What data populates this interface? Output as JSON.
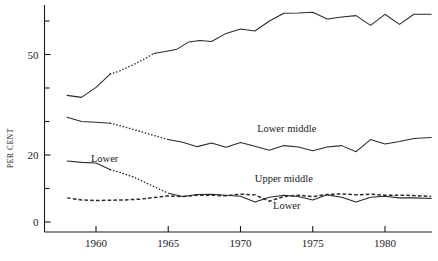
{
  "chart_data": {
    "type": "line",
    "title": "",
    "xlabel": "",
    "ylabel": "PER CENT",
    "xlim": [
      1957.2,
      1983.6
    ],
    "ylim": [
      -2,
      72
    ],
    "grid": false,
    "legend": "inline-annotations",
    "y_ticks_major": [
      0,
      20,
      50
    ],
    "y_ticks_minor": [
      10,
      30,
      40,
      60
    ],
    "x_ticks": [
      1960,
      1965,
      1970,
      1975,
      1980
    ],
    "x_tick_labels": [
      "1960",
      "1965",
      "1970",
      "1975",
      "1980"
    ],
    "y_tick_labels": [
      "0",
      "20",
      "50"
    ],
    "series": [
      {
        "name": "Middle middle",
        "style": "solid-with-dotted-gap",
        "label_x": 1973.0,
        "label_y": 70.0,
        "x": [
          1958.0,
          1959.0,
          1960.0,
          1961.0,
          1961.6,
          1962.4,
          1963.2,
          1964.0,
          1964.8,
          1965.6,
          1966.4,
          1967.2,
          1968.0,
          1969.0,
          1970.0,
          1971.0,
          1972.0,
          1973.0,
          1974.0,
          1975.0,
          1976.0,
          1977.0,
          1978.0,
          1979.0,
          1980.0,
          1981.0,
          1982.0,
          1983.2
        ],
        "y": [
          37.8,
          37.2,
          40.2,
          44.2,
          45.0,
          46.6,
          48.3,
          50.3,
          50.9,
          51.6,
          53.7,
          54.2,
          53.9,
          56.3,
          57.6,
          57.0,
          60.0,
          62.3,
          62.4,
          62.6,
          60.6,
          61.2,
          61.6,
          58.7,
          62.0,
          59.0,
          62.0,
          62.0
        ],
        "dotted_segment_x": [
          1961.0,
          1964.0
        ],
        "notes": "rises from ~38 to ~62 per cent"
      },
      {
        "name": "Lower middle",
        "style": "solid-with-dotted-gap",
        "label_x": 1973.2,
        "label_y": 27.0,
        "x": [
          1958.0,
          1959.0,
          1960.0,
          1961.0,
          1961.8,
          1962.6,
          1963.4,
          1964.2,
          1965.0,
          1966.0,
          1967.0,
          1968.0,
          1969.0,
          1970.0,
          1971.0,
          1972.0,
          1973.0,
          1974.0,
          1975.0,
          1976.0,
          1977.0,
          1978.0,
          1979.0,
          1980.0,
          1981.0,
          1982.0,
          1983.2
        ],
        "y": [
          31.3,
          30.0,
          29.8,
          29.5,
          28.6,
          27.6,
          26.6,
          25.6,
          24.6,
          23.8,
          22.5,
          23.6,
          22.3,
          23.7,
          22.6,
          21.4,
          22.8,
          22.4,
          21.3,
          22.4,
          22.8,
          21.0,
          24.6,
          23.3,
          24.0,
          24.9,
          25.2
        ],
        "dotted_segment_x": [
          1961.0,
          1965.0
        ],
        "notes": "declines from ~31 to ~25 per cent"
      },
      {
        "name": "Lower",
        "style": "solid-with-dotted-gap",
        "label_x": 1960.6,
        "label_y": 18.0,
        "label2_x": 1973.2,
        "label2_y": 4.0,
        "x": [
          1958.0,
          1959.0,
          1960.0,
          1961.0,
          1961.8,
          1962.6,
          1963.4,
          1964.2,
          1965.0,
          1966.0,
          1967.0,
          1968.0,
          1969.0,
          1970.0,
          1971.0,
          1972.0,
          1973.0,
          1974.0,
          1975.0,
          1976.0,
          1977.0,
          1978.0,
          1979.0,
          1980.0,
          1981.0,
          1982.0,
          1983.2
        ],
        "y": [
          18.2,
          17.8,
          17.6,
          15.6,
          14.6,
          13.4,
          11.8,
          10.2,
          8.6,
          7.6,
          8.2,
          8.3,
          8.0,
          7.7,
          6.0,
          7.4,
          8.0,
          7.6,
          6.6,
          8.1,
          7.4,
          6.0,
          7.4,
          7.7,
          7.2,
          7.2,
          7.0
        ],
        "dotted_segment_x": [
          1961.0,
          1965.0
        ],
        "notes": "falls steeply from ~18 to ~7 per cent"
      },
      {
        "name": "Upper middle",
        "style": "dashed",
        "label_x": 1973.0,
        "label_y": 12.0,
        "x": [
          1958.0,
          1959.0,
          1960.0,
          1961.0,
          1962.0,
          1963.0,
          1964.0,
          1965.0,
          1966.0,
          1967.0,
          1968.0,
          1969.0,
          1970.0,
          1971.0,
          1972.0,
          1973.0,
          1974.0,
          1975.0,
          1976.0,
          1977.0,
          1978.0,
          1979.0,
          1980.0,
          1981.0,
          1982.0,
          1983.2
        ],
        "y": [
          7.2,
          6.6,
          6.4,
          6.5,
          6.6,
          6.8,
          7.3,
          7.8,
          7.6,
          8.0,
          8.0,
          7.8,
          8.3,
          8.1,
          6.2,
          7.6,
          8.0,
          7.6,
          8.2,
          8.4,
          8.1,
          8.3,
          8.0,
          8.0,
          7.9,
          7.6
        ],
        "notes": "near-flat dashed line around 7-8 per cent"
      }
    ]
  },
  "axis": {
    "y_label": "PER CENT",
    "y_tick_50": "50",
    "y_tick_20": "20",
    "y_tick_0": "0",
    "x_tick_1960": "1960",
    "x_tick_1965": "1965",
    "x_tick_1970": "1970",
    "x_tick_1975": "1975",
    "x_tick_1980": "1980"
  },
  "annotations": {
    "middle_middle": "Middle middle",
    "lower_middle": "Lower middle",
    "upper_middle": "Upper middle",
    "lower_left": "Lower",
    "lower_right": "Lower"
  },
  "colors": {
    "ink": "#1a1a1a",
    "curve": "#2a2a2a",
    "background": "#ffffff"
  }
}
